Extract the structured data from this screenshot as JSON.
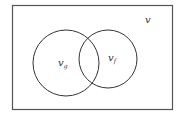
{
  "diagram": {
    "type": "venn",
    "universe_label": "v",
    "sets": [
      {
        "label": "v",
        "subscript": "g"
      },
      {
        "label": "v",
        "subscript": "f"
      }
    ],
    "colors": {
      "stroke": "#333333",
      "background": "#ffffff"
    }
  }
}
